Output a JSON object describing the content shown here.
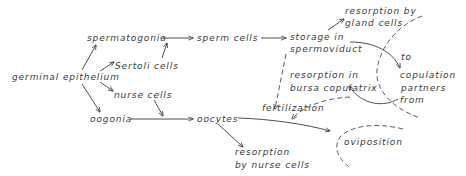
{
  "diagram": {
    "nodes": {
      "germinal_epithelium": "germinal epithelium",
      "spermatogonia": "spermatogonia",
      "sertoli_cells": "Sertoli cells",
      "nurse_cells": "nurse cells",
      "oogonia": "oogonia",
      "sperm_cells": "sperm cells",
      "storage_line1": "storage in",
      "storage_line2": "spermoviduct",
      "resorption_gland_line1": "resorption by",
      "resorption_gland_line2": "gland cells",
      "resorption_bursa_line1": "resorption in",
      "resorption_bursa_line2": "bursa copulatrix",
      "to": "to",
      "copulation_line1": "copulation",
      "copulation_line2": "partners",
      "from": "from",
      "fertilization": "fertilization",
      "oocytes": "oocytes",
      "resorption_nurse_line1": "resorption",
      "resorption_nurse_line2": "by nurse cells",
      "oviposition": "oviposition"
    },
    "edges": [
      {
        "from": "germinal epithelium",
        "to": "spermatogonia",
        "style": "solid"
      },
      {
        "from": "germinal epithelium",
        "to": "Sertoli cells",
        "style": "solid"
      },
      {
        "from": "germinal epithelium",
        "to": "nurse cells",
        "style": "solid"
      },
      {
        "from": "germinal epithelium",
        "to": "oogonia",
        "style": "solid"
      },
      {
        "from": "spermatogonia",
        "to": "sperm cells",
        "style": "solid"
      },
      {
        "from": "Sertoli cells",
        "to": "spermatogonia-sperm cells edge",
        "style": "solid"
      },
      {
        "from": "nurse cells",
        "to": "oogonia-oocytes edge",
        "style": "solid"
      },
      {
        "from": "oogonia",
        "to": "oocytes",
        "style": "solid"
      },
      {
        "from": "sperm cells",
        "to": "storage in spermoviduct",
        "style": "solid"
      },
      {
        "from": "storage in spermoviduct",
        "to": "resorption by gland cells",
        "style": "solid"
      },
      {
        "from": "storage in spermoviduct",
        "to": "copulation partners",
        "style": "solid",
        "label": "to"
      },
      {
        "from": "copulation partners",
        "to": "resorption in bursa copulatrix",
        "style": "solid",
        "label": "from"
      },
      {
        "from": "storage in spermoviduct",
        "to": "fertilization",
        "style": "dashed"
      },
      {
        "from": "bursa copulatrix",
        "to": "fertilization",
        "style": "dashed"
      },
      {
        "from": "oocytes",
        "to": "oviposition",
        "style": "solid"
      },
      {
        "from": "oocytes",
        "to": "resorption by nurse cells",
        "style": "solid"
      }
    ],
    "colors": {
      "ink": "#3a3a3a",
      "background": "#ffffff"
    }
  }
}
